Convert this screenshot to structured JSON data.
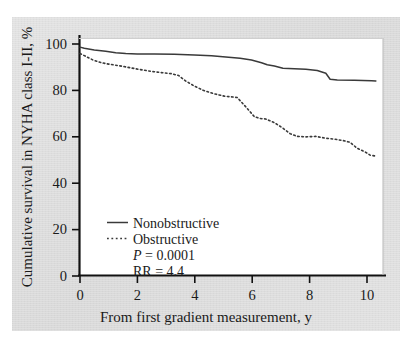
{
  "figure": {
    "background_color": "#dedede",
    "plot_background_color": "#ffffff",
    "axis_color": "#111111",
    "series_colors": {
      "nonobstructive": "#3a3a3a",
      "obstructive": "#3a3a3a"
    }
  },
  "chart_data": {
    "type": "line",
    "subtype": "kaplan-meier-survival",
    "title": "",
    "xlabel": "From first gradient measurement, y",
    "ylabel": "Cumulative survival in NYHA class I-II, %",
    "xlim": [
      0,
      10.6
    ],
    "ylim": [
      0,
      104
    ],
    "xticks": [
      0,
      2,
      4,
      6,
      8,
      10
    ],
    "xticklabels": [
      "0",
      "2",
      "4",
      "6",
      "8",
      "10"
    ],
    "yticks": [
      0,
      20,
      40,
      60,
      80,
      100
    ],
    "yticklabels": [
      "0",
      "20",
      "40",
      "60",
      "80",
      "100"
    ],
    "grid": false,
    "legend_position": "lower-left-inside",
    "annotations": [
      {
        "name": "p-value",
        "text": "P = 0.0001",
        "italic_prefix": "P"
      },
      {
        "name": "relative-risk",
        "text": "RR = 4.4",
        "italic_prefix": ""
      }
    ],
    "series": [
      {
        "name": "Nonobstructive",
        "style": "solid",
        "x": [
          0.0,
          0.15,
          0.5,
          0.9,
          1.25,
          1.6,
          2.0,
          2.6,
          3.3,
          4.0,
          4.6,
          5.2,
          5.6,
          6.0,
          6.35,
          6.55,
          6.8,
          7.1,
          7.5,
          7.9,
          8.3,
          8.6,
          8.75,
          9.0,
          9.6,
          10.2,
          10.35
        ],
        "y": [
          100.0,
          99.5,
          98.8,
          98.2,
          97.6,
          97.2,
          97.0,
          97.0,
          96.9,
          96.6,
          96.2,
          95.6,
          95.2,
          94.4,
          93.2,
          92.3,
          91.8,
          90.8,
          90.6,
          90.3,
          89.8,
          88.6,
          86.0,
          85.6,
          85.5,
          85.3,
          85.2
        ]
      },
      {
        "name": "Obstructive",
        "style": "dotted",
        "x": [
          0.0,
          0.2,
          0.45,
          0.75,
          1.0,
          1.2,
          1.5,
          1.8,
          2.1,
          2.5,
          2.9,
          3.2,
          3.45,
          3.7,
          4.0,
          4.3,
          4.7,
          5.05,
          5.35,
          5.5,
          5.75,
          5.95,
          6.1,
          6.3,
          6.5,
          6.8,
          7.1,
          7.35,
          7.6,
          7.9,
          8.25,
          8.6,
          8.9,
          9.2,
          9.45,
          9.7,
          9.95,
          10.15,
          10.35
        ],
        "y": [
          97.2,
          96.0,
          94.4,
          93.2,
          92.6,
          92.2,
          91.6,
          90.9,
          90.2,
          89.4,
          88.8,
          88.4,
          87.6,
          85.2,
          83.0,
          81.2,
          79.6,
          78.6,
          78.2,
          78.0,
          74.6,
          71.8,
          69.6,
          68.8,
          68.6,
          67.0,
          64.6,
          62.2,
          61.0,
          60.8,
          61.0,
          60.2,
          59.8,
          59.2,
          58.4,
          55.8,
          54.4,
          52.8,
          52.4
        ]
      }
    ]
  },
  "legend": {
    "items": [
      {
        "label": "Nonobstructive",
        "style": "solid"
      },
      {
        "label": "Obstructive",
        "style": "dotted"
      }
    ]
  }
}
